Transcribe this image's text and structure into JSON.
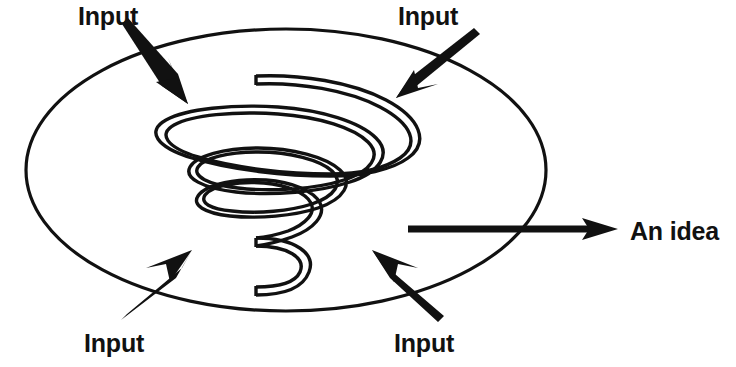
{
  "diagram": {
    "colors": {
      "ink": "#111111",
      "background": "#ffffff"
    },
    "boundary": {
      "shape_name": "ellipse",
      "center_x": 286,
      "center_y": 170,
      "radius_x": 260,
      "radius_y": 141
    },
    "inputs": [
      {
        "label": "Input",
        "position": "top-left",
        "text_x": 78,
        "text_y": 25,
        "tail_x": 122,
        "tail_y": 30,
        "tip_x": 188,
        "tip_y": 104
      },
      {
        "label": "Input",
        "position": "top-right",
        "text_x": 398,
        "text_y": 25,
        "tail_x": 473,
        "tail_y": 32,
        "tip_x": 396,
        "tip_y": 98
      },
      {
        "label": "Input",
        "position": "bottom-left",
        "text_x": 84,
        "text_y": 352,
        "tail_x": 123,
        "tail_y": 317,
        "tip_x": 192,
        "tip_y": 252
      },
      {
        "label": "Input",
        "position": "bottom-right",
        "text_x": 394,
        "text_y": 352,
        "tail_x": 437,
        "tail_y": 318,
        "tip_x": 372,
        "tip_y": 252
      }
    ],
    "output": {
      "label": "An idea",
      "text_x": 630,
      "text_y": 240,
      "shaft_start_x": 408,
      "shaft_end_x": 588,
      "tip_x": 618,
      "center_y": 229,
      "shaft_thickness": 7
    },
    "spiral": {
      "shape_name": "conical-helix",
      "turns": 3,
      "start_x": 256,
      "start_y": 76,
      "end_x": 256,
      "end_y": 287,
      "tube_width": 8
    }
  }
}
